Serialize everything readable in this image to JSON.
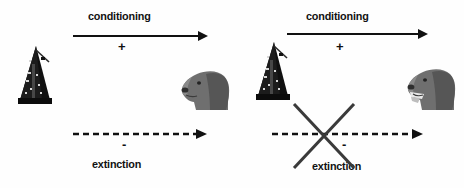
{
  "figure": {
    "title_visible": false,
    "background_color": "#fefefe",
    "ink_color": "#111111",
    "cross_color": "#3a3a3a",
    "width": 464,
    "height": 188
  },
  "panels": [
    {
      "id": "panel-acquisition",
      "stimulus": {
        "icon": "metronome-icon",
        "label": "metronome",
        "color": "#101010"
      },
      "response": {
        "icon": "dog-head-icon",
        "label": "dog",
        "color": "#6f6f6f",
        "salivating": false
      },
      "top_process": {
        "name": "conditioning",
        "label": "conditioning",
        "sign": "+",
        "arrow_style": "solid",
        "arrow_crossed": false
      },
      "bottom_process": {
        "name": "extinction",
        "label": "extinction",
        "sign": "-",
        "arrow_style": "dashed",
        "arrow_crossed": false
      }
    },
    {
      "id": "panel-extinction-blocked",
      "stimulus": {
        "icon": "metronome-icon",
        "label": "metronome",
        "color": "#101010"
      },
      "response": {
        "icon": "dog-head-icon",
        "label": "dog",
        "color": "#6f6f6f",
        "salivating": true
      },
      "top_process": {
        "name": "conditioning",
        "label": "conditioning",
        "sign": "+",
        "arrow_style": "solid",
        "arrow_crossed": false
      },
      "bottom_process": {
        "name": "extinction",
        "label": "extinction",
        "sign": "-",
        "arrow_style": "dashed",
        "arrow_crossed": true,
        "cross_icon": "x-cross-icon"
      }
    }
  ]
}
